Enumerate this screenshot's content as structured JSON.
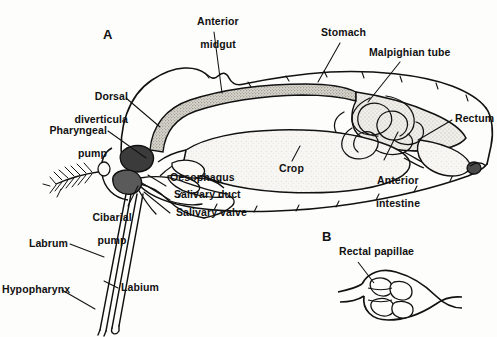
{
  "figure": {
    "title_letters": {
      "panel_a": "A",
      "panel_b": "B"
    },
    "colors": {
      "ink": "#111111",
      "background": "#fdfdfb",
      "shade_light": "#e8e6e0",
      "shade_mid": "#b9b6ae",
      "shade_dark": "#2a2a2a"
    }
  },
  "panel_a": {
    "letter": "A",
    "labels": [
      {
        "key": "anterior_midgut",
        "text": "Anterior\nmidgut",
        "name": "label-anterior-midgut"
      },
      {
        "key": "stomach",
        "text": "Stomach",
        "name": "label-stomach"
      },
      {
        "key": "malpighian_tube",
        "text": "Malpighian tube",
        "name": "label-malpighian-tube"
      },
      {
        "key": "rectum",
        "text": "Rectum",
        "name": "label-rectum"
      },
      {
        "key": "dorsal_diverticula",
        "text": "Dorsal\ndiverticula",
        "name": "label-dorsal-diverticula"
      },
      {
        "key": "pharyngeal_pump",
        "text": "Pharyngeal\npump",
        "name": "label-pharyngeal-pump"
      },
      {
        "key": "oesophagus",
        "text": "Oesophagus",
        "name": "label-oesophagus"
      },
      {
        "key": "salivary_duct",
        "text": "Salivary duct",
        "name": "label-salivary-duct"
      },
      {
        "key": "salivary_valve",
        "text": "Salivary valve",
        "name": "label-salivary-valve"
      },
      {
        "key": "cibarial_pump",
        "text": "Cibarial\npump",
        "name": "label-cibarial-pump"
      },
      {
        "key": "labrum",
        "text": "Labrum",
        "name": "label-labrum"
      },
      {
        "key": "labium",
        "text": "Labium",
        "name": "label-labium"
      },
      {
        "key": "hypopharynx",
        "text": "Hypopharynx",
        "name": "label-hypopharynx"
      },
      {
        "key": "crop",
        "text": "Crop",
        "name": "label-crop"
      },
      {
        "key": "anterior_intestine",
        "text": "Anterior\nintestine",
        "name": "label-anterior-intestine"
      }
    ],
    "text": {
      "anterior_midgut_l1": "Anterior",
      "anterior_midgut_l2": "midgut",
      "stomach": "Stomach",
      "malpighian_tube": "Malpighian tube",
      "rectum": "Rectum",
      "dorsal_diverticula_l1": "Dorsal",
      "dorsal_diverticula_l2": "diverticula",
      "pharyngeal_pump_l1": "Pharyngeal",
      "pharyngeal_pump_l2": "pump",
      "oesophagus": "Oesophagus",
      "salivary_duct": "Salivary duct",
      "salivary_valve": "Salivary valve",
      "cibarial_pump_l1": "Cibarial",
      "cibarial_pump_l2": "pump",
      "labrum": "Labrum",
      "labium": "Labium",
      "hypopharynx": "Hypopharynx",
      "crop": "Crop",
      "anterior_intestine_l1": "Anterior",
      "anterior_intestine_l2": "intestine"
    }
  },
  "panel_b": {
    "letter": "B",
    "labels": [
      {
        "key": "rectal_papillae",
        "text": "Rectal papillae",
        "name": "label-rectal-papillae"
      }
    ],
    "text": {
      "rectal_papillae": "Rectal papillae"
    }
  }
}
